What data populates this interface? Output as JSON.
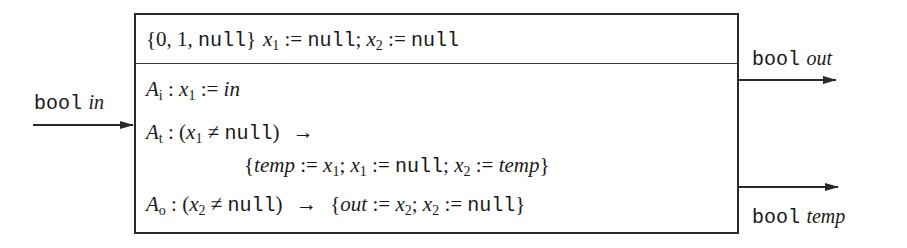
{
  "diagram": {
    "type": "component-block",
    "header": {
      "domain": "{0, 1, null}",
      "domain_parts": [
        "{0, 1, ",
        "null",
        "}"
      ],
      "init": "x1 := null; x2 := null",
      "init_parts": {
        "x": "x",
        "sub1": "1",
        "assign": " := ",
        "null": "null",
        "sep": "; ",
        "sub2": "2"
      }
    },
    "actions": [
      {
        "name": "A",
        "sub": "i",
        "text": "A_i : x1 := in",
        "rhs": "in"
      },
      {
        "name": "A",
        "sub": "t",
        "text": "A_t : (x1 ≠ null) → {temp := x1; x1 := null; x2 := temp}",
        "guard_var_sub": "1",
        "neq": " ≠ ",
        "null": "null",
        "arrow": "→",
        "temp": "temp"
      },
      {
        "name": "A",
        "sub": "o",
        "text": "A_o : (x2 ≠ null) → {out := x2; x2 := null}",
        "guard_var_sub": "2",
        "out": "out"
      }
    ],
    "ports": {
      "input": {
        "type": "bool",
        "name": "in"
      },
      "outputs": [
        {
          "type": "bool",
          "name": "out"
        },
        {
          "type": "bool",
          "name": "temp"
        }
      ]
    },
    "symbols": {
      "colon": " : ",
      "assign": " := ",
      "semi": "; ",
      "lbrace": "{",
      "rbrace": "}",
      "lparen": "(",
      "rparen": ")",
      "x": "x"
    },
    "colors": {
      "stroke": "#2a2a2a",
      "text": "#1a1a1a",
      "background": "#ffffff"
    }
  }
}
